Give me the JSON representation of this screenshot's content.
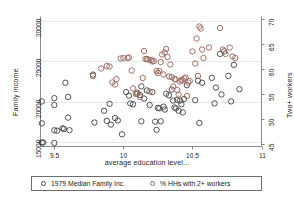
{
  "chart_data": {
    "type": "scatter",
    "title": "",
    "xlabel": "average education level...",
    "ylabel": "Family income",
    "ylabel_right": "Two+ workers",
    "xlim": [
      9.4,
      11.0
    ],
    "ylim": [
      14500,
      30500
    ],
    "ylim_right": [
      44.5,
      70.5
    ],
    "xticks": [
      "9.5",
      "10",
      "10.5",
      "11"
    ],
    "xtick_values": [
      9.5,
      10,
      10.5,
      11
    ],
    "yticks": [
      "15000",
      "20000",
      "25000",
      "30000"
    ],
    "ytick_values": [
      15000,
      20000,
      25000,
      30000
    ],
    "yticks_right": [
      "45",
      "50",
      "55",
      "60",
      "65",
      "70"
    ],
    "ytick_values_right": [
      45,
      50,
      55,
      60,
      65,
      70
    ],
    "grid": "horizontal",
    "legend_position": "bottom",
    "marker": "open-circle",
    "series": [
      {
        "name": "1979 Median Family Inc.",
        "axis": "left",
        "color": "#4a4a4a",
        "points": [
          [
            9.41,
            20050
          ],
          [
            9.41,
            17350
          ],
          [
            9.41,
            15000
          ],
          [
            9.42,
            14980
          ],
          [
            9.5,
            19600
          ],
          [
            9.5,
            20450
          ],
          [
            9.5,
            16500
          ],
          [
            9.5,
            14930
          ],
          [
            9.52,
            16450
          ],
          [
            9.56,
            16750
          ],
          [
            9.57,
            16650
          ],
          [
            9.58,
            22350
          ],
          [
            9.6,
            20600
          ],
          [
            9.6,
            18050
          ],
          [
            9.61,
            16500
          ],
          [
            9.78,
            23350
          ],
          [
            9.79,
            17450
          ],
          [
            9.86,
            18900
          ],
          [
            9.88,
            17650
          ],
          [
            9.9,
            19750
          ],
          [
            9.91,
            17200
          ],
          [
            9.94,
            18000
          ],
          [
            9.96,
            17700
          ],
          [
            9.99,
            16000
          ],
          [
            10.02,
            21200
          ],
          [
            10.04,
            20750
          ],
          [
            10.05,
            19800
          ],
          [
            10.07,
            19700
          ],
          [
            10.1,
            21000
          ],
          [
            10.12,
            20850
          ],
          [
            10.13,
            21900
          ],
          [
            10.13,
            17600
          ],
          [
            10.15,
            20400
          ],
          [
            10.17,
            21400
          ],
          [
            10.19,
            19600
          ],
          [
            10.21,
            21200
          ],
          [
            10.23,
            17550
          ],
          [
            10.24,
            16550
          ],
          [
            10.25,
            19250
          ],
          [
            10.26,
            19200
          ],
          [
            10.27,
            17600
          ],
          [
            10.29,
            19400
          ],
          [
            10.3,
            19050
          ],
          [
            10.31,
            21000
          ],
          [
            10.33,
            20800
          ],
          [
            10.35,
            21500
          ],
          [
            10.36,
            20150
          ],
          [
            10.37,
            19300
          ],
          [
            10.38,
            19200
          ],
          [
            10.39,
            20250
          ],
          [
            10.4,
            18900
          ],
          [
            10.41,
            20150
          ],
          [
            10.42,
            19700
          ],
          [
            10.43,
            18700
          ],
          [
            10.44,
            20350
          ],
          [
            10.46,
            22050
          ],
          [
            10.52,
            20200
          ],
          [
            10.54,
            22600
          ],
          [
            10.55,
            17400
          ],
          [
            10.57,
            22350
          ],
          [
            10.64,
            22950
          ],
          [
            10.66,
            19800
          ],
          [
            10.67,
            21750
          ],
          [
            10.7,
            25900
          ],
          [
            10.71,
            20900
          ],
          [
            10.73,
            26200
          ],
          [
            10.76,
            23200
          ],
          [
            10.78,
            20050
          ],
          [
            10.8,
            24550
          ],
          [
            10.84,
            21550
          ]
        ]
      },
      {
        "name": "% HHs with 2+ workers",
        "axis": "right",
        "color": "#9a6a62",
        "points": [
          [
            9.78,
            58.6
          ],
          [
            9.84,
            60.1
          ],
          [
            9.88,
            60.6
          ],
          [
            9.9,
            60.5
          ],
          [
            9.92,
            57.3
          ],
          [
            9.94,
            56.9
          ],
          [
            9.95,
            58.0
          ],
          [
            9.98,
            62.1
          ],
          [
            10.0,
            62.2
          ],
          [
            10.03,
            62.2
          ],
          [
            10.04,
            62.3
          ],
          [
            10.06,
            59.7
          ],
          [
            10.07,
            56.1
          ],
          [
            10.09,
            55.0
          ],
          [
            10.1,
            55.3
          ],
          [
            10.12,
            54.4
          ],
          [
            10.14,
            58.2
          ],
          [
            10.15,
            63.6
          ],
          [
            10.16,
            62.0
          ],
          [
            10.17,
            62.0
          ],
          [
            10.18,
            61.9
          ],
          [
            10.19,
            55.5
          ],
          [
            10.2,
            61.8
          ],
          [
            10.21,
            61.5
          ],
          [
            10.22,
            61.6
          ],
          [
            10.24,
            59.6
          ],
          [
            10.25,
            59.2
          ],
          [
            10.26,
            59.6
          ],
          [
            10.27,
            61.4
          ],
          [
            10.28,
            62.9
          ],
          [
            10.29,
            58.9
          ],
          [
            10.3,
            63.3
          ],
          [
            10.31,
            64.0
          ],
          [
            10.32,
            62.4
          ],
          [
            10.33,
            58.5
          ],
          [
            10.34,
            60.9
          ],
          [
            10.35,
            58.4
          ],
          [
            10.36,
            56.5
          ],
          [
            10.37,
            58.0
          ],
          [
            10.38,
            57.9
          ],
          [
            10.39,
            55.8
          ],
          [
            10.4,
            54.9
          ],
          [
            10.41,
            57.5
          ],
          [
            10.42,
            57.8
          ],
          [
            10.43,
            57.7
          ],
          [
            10.44,
            58.1
          ],
          [
            10.45,
            58.3
          ],
          [
            10.46,
            54.6
          ],
          [
            10.47,
            57.3
          ],
          [
            10.48,
            57.6
          ],
          [
            10.5,
            63.5
          ],
          [
            10.52,
            61.1
          ],
          [
            10.53,
            66.1
          ],
          [
            10.54,
            58.6
          ],
          [
            10.55,
            68.5
          ],
          [
            10.56,
            68.1
          ],
          [
            10.57,
            63.9
          ],
          [
            10.58,
            62.2
          ],
          [
            10.62,
            64.3
          ],
          [
            10.7,
            68.2
          ],
          [
            10.72,
            63.9
          ],
          [
            10.74,
            63.0
          ],
          [
            10.77,
            64.3
          ],
          [
            10.79,
            62.5
          ],
          [
            10.81,
            62.2
          ]
        ]
      }
    ]
  },
  "legend": {
    "items": [
      {
        "label": "1979 Median Family Inc."
      },
      {
        "label": "% HHs with 2+ workers"
      }
    ]
  }
}
